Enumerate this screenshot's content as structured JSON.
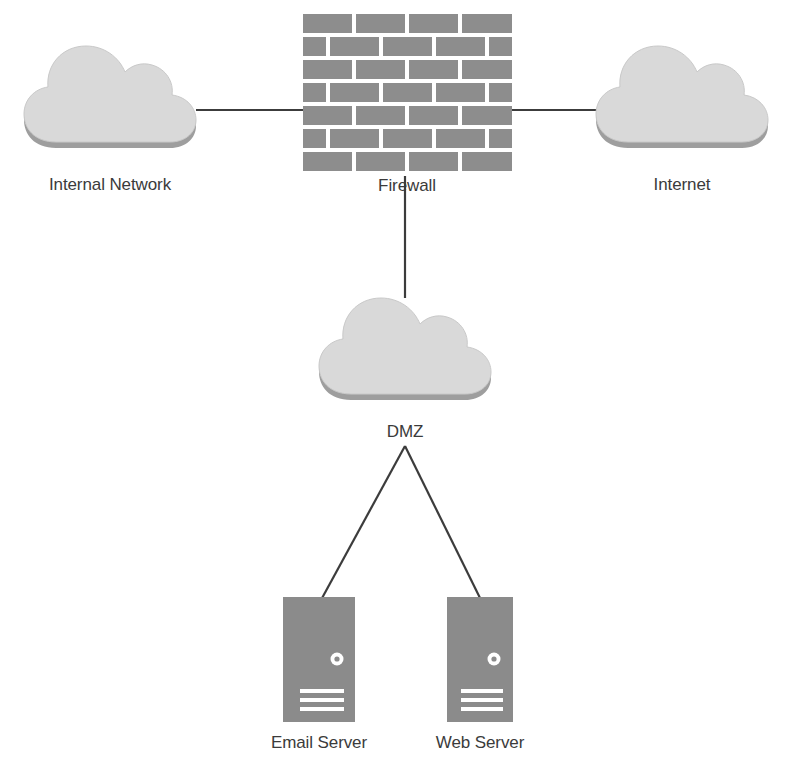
{
  "diagram": {
    "type": "network-topology",
    "background_color": "#ffffff",
    "label_color": "#3b3b3b",
    "link_color": "#3c3c3c",
    "colors": {
      "cloud_fill": "#d9d9d9",
      "cloud_edge": "#c4c4c4",
      "cloud_base_shadow": "#9e9e9e",
      "brick_fill": "#8d8d8d",
      "brick_gap": "#ffffff",
      "server_fill": "#8b8b8b",
      "server_detail": "#ffffff"
    },
    "nodes": [
      {
        "id": "internal-network",
        "label": "Internal Network",
        "shape": "cloud",
        "cx": 110,
        "cy": 100,
        "label_x": 110,
        "label_y": 190
      },
      {
        "id": "firewall",
        "label": "Firewall",
        "shape": "brick-wall",
        "x": 303,
        "y": 14,
        "width": 209,
        "height": 160,
        "label_x": 407,
        "label_y": 191
      },
      {
        "id": "internet",
        "label": "Internet",
        "shape": "cloud",
        "cx": 682,
        "cy": 100,
        "label_x": 682,
        "label_y": 190
      },
      {
        "id": "dmz",
        "label": "DMZ",
        "shape": "cloud",
        "cx": 405,
        "cy": 352,
        "label_x": 405,
        "label_y": 437
      },
      {
        "id": "email-server",
        "label": "Email Server",
        "shape": "server",
        "x": 283,
        "y": 597,
        "width": 72,
        "height": 125,
        "label_x": 319,
        "label_y": 748
      },
      {
        "id": "web-server",
        "label": "Web Server",
        "shape": "server",
        "x": 447,
        "y": 597,
        "width": 66,
        "height": 125,
        "label_x": 480,
        "label_y": 748
      }
    ],
    "links": [
      {
        "id": "link-internal-firewall",
        "from": "internal-network",
        "to": "firewall",
        "x1": 196,
        "y1": 110,
        "x2": 303,
        "y2": 110
      },
      {
        "id": "link-firewall-internet",
        "from": "firewall",
        "to": "internet",
        "x1": 512,
        "y1": 110,
        "x2": 600,
        "y2": 110
      },
      {
        "id": "link-firewall-dmz",
        "from": "firewall",
        "to": "dmz",
        "x1": 405,
        "y1": 176,
        "x2": 405,
        "y2": 296
      },
      {
        "id": "link-dmz-email",
        "from": "dmz",
        "to": "email-server",
        "x1": 405,
        "y1": 445,
        "x2": 322,
        "y2": 597
      },
      {
        "id": "link-dmz-web",
        "from": "dmz",
        "to": "web-server",
        "x1": 405,
        "y1": 445,
        "x2": 482,
        "y2": 597
      }
    ],
    "firewall_brick_rows": [
      {
        "row": 1,
        "offset": 0
      },
      {
        "row": 2,
        "offset": 1
      },
      {
        "row": 3,
        "offset": 0
      },
      {
        "row": 4,
        "offset": 1
      },
      {
        "row": 5,
        "offset": 0
      },
      {
        "row": 6,
        "offset": 1
      },
      {
        "row": 7,
        "offset": 0
      }
    ],
    "server_details": {
      "power_indicator": "power-led",
      "vent_lines": 3
    }
  }
}
